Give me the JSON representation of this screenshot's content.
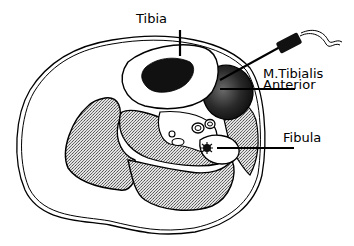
{
  "figure": {
    "type": "cross-section anatomical line drawing of lower leg",
    "colors": {
      "background": "#ffffff",
      "ink": "#000000",
      "stipple_fill": "#c8c8c8",
      "muscle_dark": "#3a3a3a"
    }
  },
  "labels": {
    "tibia": "Tibia",
    "muscle_line1": "M.Tibialis",
    "muscle_line2": "Anterior",
    "fibula": "Fibula"
  },
  "structures": {
    "skin": "outer skin contour",
    "tibia_bone": "tibia bone with dark marrow",
    "tibialis_anterior": "dark shaded muscle",
    "fibula_bone": "fibula with star marrow",
    "electrode": "needle electrode with cable"
  }
}
